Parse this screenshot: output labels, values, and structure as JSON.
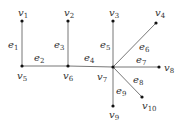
{
  "graph": {
    "vertices": [
      {
        "id": "v1",
        "base": "v",
        "sub": "1",
        "x": 22,
        "y": 21,
        "lx": 18,
        "ly": 16
      },
      {
        "id": "v2",
        "base": "v",
        "sub": "2",
        "x": 68,
        "y": 21,
        "lx": 64,
        "ly": 16
      },
      {
        "id": "v3",
        "base": "v",
        "sub": "3",
        "x": 113,
        "y": 21,
        "lx": 109,
        "ly": 16
      },
      {
        "id": "v4",
        "base": "v",
        "sub": "4",
        "x": 156,
        "y": 23,
        "lx": 155,
        "ly": 16
      },
      {
        "id": "v5",
        "base": "v",
        "sub": "5",
        "x": 22,
        "y": 66,
        "lx": 17,
        "ly": 79
      },
      {
        "id": "v6",
        "base": "v",
        "sub": "6",
        "x": 68,
        "y": 66,
        "lx": 63,
        "ly": 79
      },
      {
        "id": "v7",
        "base": "v",
        "sub": "7",
        "x": 113,
        "y": 67,
        "lx": 97,
        "ly": 80
      },
      {
        "id": "v8",
        "base": "v",
        "sub": "8",
        "x": 159,
        "y": 67,
        "lx": 164,
        "ly": 71
      },
      {
        "id": "v9",
        "base": "v",
        "sub": "9",
        "x": 113,
        "y": 106,
        "lx": 109,
        "ly": 118
      },
      {
        "id": "v10",
        "base": "v",
        "sub": "10",
        "x": 142,
        "y": 97,
        "lx": 142,
        "ly": 109
      }
    ],
    "edges": [
      {
        "id": "e1",
        "base": "e",
        "sub": "1",
        "from": "v1",
        "to": "v5",
        "lx": 8,
        "ly": 48
      },
      {
        "id": "e2",
        "base": "e",
        "sub": "2",
        "from": "v5",
        "to": "v6",
        "lx": 34,
        "ly": 61
      },
      {
        "id": "e3",
        "base": "e",
        "sub": "3",
        "from": "v2",
        "to": "v6",
        "lx": 54,
        "ly": 48
      },
      {
        "id": "e4",
        "base": "e",
        "sub": "4",
        "from": "v6",
        "to": "v7",
        "lx": 84,
        "ly": 61
      },
      {
        "id": "e5",
        "base": "e",
        "sub": "5",
        "from": "v3",
        "to": "v7",
        "lx": 100,
        "ly": 48
      },
      {
        "id": "e6",
        "base": "e",
        "sub": "6",
        "from": "v7",
        "to": "v4",
        "lx": 139,
        "ly": 50
      },
      {
        "id": "e7",
        "base": "e",
        "sub": "7",
        "from": "v7",
        "to": "v8",
        "lx": 136,
        "ly": 63
      },
      {
        "id": "e8",
        "base": "e",
        "sub": "8",
        "from": "v7",
        "to": "v10",
        "lx": 133,
        "ly": 83
      },
      {
        "id": "e9",
        "base": "e",
        "sub": "9",
        "from": "v7",
        "to": "v9",
        "lx": 116,
        "ly": 94
      }
    ]
  }
}
